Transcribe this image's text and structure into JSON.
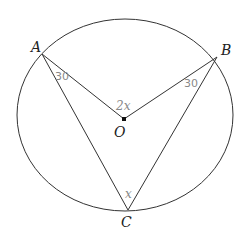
{
  "diagram": {
    "type": "circle-geometry",
    "points": {
      "A": {
        "label": "A",
        "x": 42,
        "y": 54
      },
      "B": {
        "label": "B",
        "x": 217,
        "y": 57
      },
      "C": {
        "label": "C",
        "x": 128,
        "y": 210
      },
      "O": {
        "label": "O",
        "x": 124,
        "y": 128
      }
    },
    "angle_labels": {
      "OAC": "30",
      "OBC": "30",
      "AOB": "2x",
      "ACB": "x"
    },
    "colors": {
      "stroke": "#333333",
      "angle_text": "#888888"
    }
  }
}
